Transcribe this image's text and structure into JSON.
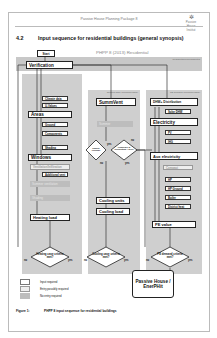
{
  "page": {
    "running_header": "Passive House Planning Package 8",
    "logo": {
      "glyph": "✲",
      "text": "Passive House Institut"
    },
    "section_number": "4.2",
    "section_title": "Input sequence for residential buildings (general synopsis)"
  },
  "diagram": {
    "title": "PHPP 8 (2013) Residential",
    "start": "Start",
    "verification": "Verification",
    "band_label": "Residential/nonresidential",
    "columns": {
      "heating": {
        "panel_label": "",
        "items": [
          {
            "label": "Climate data",
            "type": "sub"
          },
          {
            "label": "U-Values",
            "type": "sub"
          },
          {
            "label": "Areas",
            "type": "main"
          },
          {
            "label": "Ground",
            "type": "sub"
          },
          {
            "label": "Components",
            "type": "sub"
          },
          {
            "label": "Shading",
            "type": "sub"
          },
          {
            "label": "Windows",
            "type": "main"
          },
          {
            "label": "Ventilation/Infiltration",
            "type": "optional"
          },
          {
            "label": "Additional vent",
            "type": "sub"
          },
          {
            "label": "Summer ventilation",
            "type": "none"
          },
          {
            "label": "Shading",
            "type": "none"
          },
          {
            "label": "Heating load",
            "type": "main"
          }
        ],
        "decision": {
          "label": "Heating case criteria met?",
          "no": "no",
          "yes": "yes"
        }
      },
      "cooling": {
        "panel_label": "Cooling case (recommended)",
        "items": [
          {
            "label": "SummVent",
            "type": "main"
          },
          {
            "label": "Summer",
            "type": "none"
          },
          {
            "label": "Cooling units",
            "type": "main"
          },
          {
            "label": "Cooling load",
            "type": "main"
          }
        ],
        "decision_a": {
          "label": "Passive cooling?",
          "no": "no",
          "yes": "yes"
        },
        "decision_b": {
          "label": "Frequency of overheating > 10%?",
          "no": "no",
          "yes": "yes"
        },
        "decision": {
          "label": "Cooling case criteria met?",
          "no": "no",
          "yes": "yes"
        }
      },
      "primary_energy": {
        "panel_label": "PE demand (recommended)",
        "items": [
          {
            "label": "DHW+ Distribution",
            "type": "main"
          },
          {
            "label": "Solar DHW",
            "type": "sub"
          },
          {
            "label": "Electricity",
            "type": "main"
          },
          {
            "label": "PV",
            "type": "sub"
          },
          {
            "label": "IHG",
            "type": "sub"
          },
          {
            "label": "Aux electricity",
            "type": "main"
          },
          {
            "label": "Compact",
            "type": "optional"
          },
          {
            "label": "HP",
            "type": "sub"
          },
          {
            "label": "HP Ground",
            "type": "sub"
          },
          {
            "label": "Boiler",
            "type": "sub"
          },
          {
            "label": "District heat",
            "type": "sub"
          },
          {
            "label": "PE value",
            "type": "main"
          }
        ],
        "decision": {
          "label": "PE demand criteria met?",
          "no": "no",
          "yes": "yes"
        }
      }
    },
    "result": "Passive House / EnerPHit"
  },
  "legend": [
    {
      "label": "Input required",
      "color": "#ffffff"
    },
    {
      "label": "Entry possibly required",
      "color": "#eeeeee"
    },
    {
      "label": "No entry required",
      "color": "#bdbdbd"
    }
  ],
  "figure": {
    "number": "Figure 1:",
    "caption": "PHPP 8 input sequence for residential buildings"
  },
  "colors": {
    "panel": "#cfcfcf",
    "band": "#c8c8c8",
    "line": "#333333"
  }
}
